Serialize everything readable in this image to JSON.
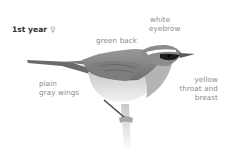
{
  "plate": {
    "age_label": "1st year",
    "sex_symbol": "♀",
    "illustration": "warbler-perched-side-view",
    "annotations": [
      {
        "id": "green-back",
        "lines": [
          "green back"
        ]
      },
      {
        "id": "white-eyebrow",
        "lines": [
          "white",
          "eyebrow"
        ]
      },
      {
        "id": "plain-gray-wings",
        "lines": [
          "plain",
          "gray wings"
        ]
      },
      {
        "id": "yellow-throat-breast",
        "lines": [
          "yellow",
          "throat and",
          "breast"
        ]
      }
    ]
  },
  "colors": {
    "label_text": "#8a8a8a",
    "age_text": "#333333",
    "background": "#ffffff"
  }
}
